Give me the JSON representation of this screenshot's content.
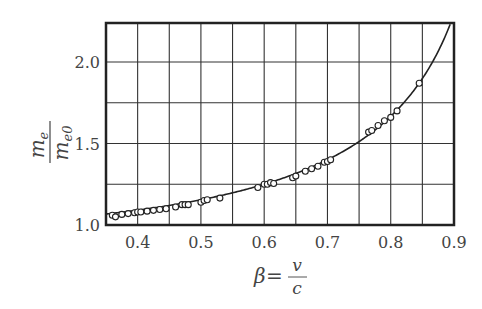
{
  "chart_data": {
    "type": "scatter",
    "title": "",
    "xlabel": "β = v / c",
    "ylabel": "m_e / m_e0",
    "xlabel_parts": {
      "lhs": "β",
      "eq": "=",
      "num": "v",
      "den": "c"
    },
    "ylabel_parts": {
      "num": "m",
      "num_sub": "e",
      "den": "m",
      "den_sub": "e0"
    },
    "xlim": [
      0.35,
      0.9
    ],
    "ylim": [
      1.0,
      2.25
    ],
    "x_ticks": [
      0.4,
      0.5,
      0.6,
      0.7,
      0.8,
      0.9
    ],
    "x_tick_labels": [
      "0.4",
      "0.5",
      "0.6",
      "0.7",
      "0.8",
      "0.9"
    ],
    "y_ticks": [
      1.0,
      1.5,
      2.0
    ],
    "y_tick_labels": [
      "1.0",
      "1.5",
      "2.0"
    ],
    "x_grid": [
      0.4,
      0.45,
      0.5,
      0.55,
      0.6,
      0.65,
      0.7,
      0.75,
      0.8,
      0.85
    ],
    "y_grid": [
      1.25,
      1.5,
      1.75,
      2.0
    ],
    "grid": true,
    "legend": null,
    "series": [
      {
        "name": "measured",
        "marker": "open-circle",
        "points": [
          [
            0.36,
            1.06
          ],
          [
            0.365,
            1.05
          ],
          [
            0.375,
            1.065
          ],
          [
            0.385,
            1.07
          ],
          [
            0.395,
            1.075
          ],
          [
            0.4,
            1.08
          ],
          [
            0.405,
            1.08
          ],
          [
            0.415,
            1.085
          ],
          [
            0.425,
            1.09
          ],
          [
            0.435,
            1.095
          ],
          [
            0.445,
            1.1
          ],
          [
            0.46,
            1.11
          ],
          [
            0.47,
            1.125
          ],
          [
            0.475,
            1.125
          ],
          [
            0.48,
            1.125
          ],
          [
            0.5,
            1.14
          ],
          [
            0.505,
            1.15
          ],
          [
            0.51,
            1.155
          ],
          [
            0.53,
            1.165
          ],
          [
            0.59,
            1.23
          ],
          [
            0.6,
            1.25
          ],
          [
            0.605,
            1.25
          ],
          [
            0.61,
            1.26
          ],
          [
            0.615,
            1.255
          ],
          [
            0.645,
            1.29
          ],
          [
            0.65,
            1.3
          ],
          [
            0.665,
            1.33
          ],
          [
            0.675,
            1.345
          ],
          [
            0.685,
            1.36
          ],
          [
            0.695,
            1.385
          ],
          [
            0.7,
            1.39
          ],
          [
            0.705,
            1.4
          ],
          [
            0.765,
            1.57
          ],
          [
            0.77,
            1.58
          ],
          [
            0.78,
            1.61
          ],
          [
            0.79,
            1.64
          ],
          [
            0.8,
            1.66
          ],
          [
            0.81,
            1.7
          ],
          [
            0.845,
            1.87
          ]
        ]
      },
      {
        "name": "theory",
        "type": "line",
        "formula": "1/sqrt(1-β^2)",
        "x_range": [
          0.35,
          0.895
        ]
      }
    ]
  }
}
